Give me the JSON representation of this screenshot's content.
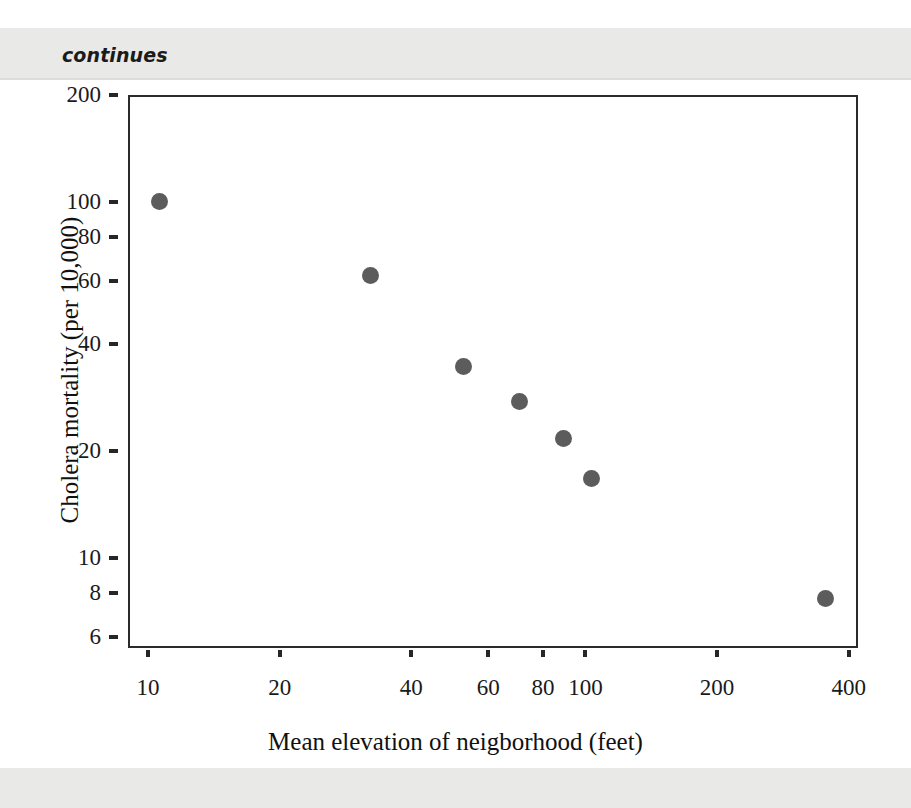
{
  "page": {
    "marginalia": "continues"
  },
  "chart_data": {
    "type": "scatter",
    "title": "",
    "xlabel": "Mean elevation of neigborhood (feet)",
    "ylabel": "Cholera mortality (per 10,000)",
    "xscale": "log",
    "yscale": "log",
    "xlim": [
      9,
      420
    ],
    "ylim": [
      5.6,
      200
    ],
    "grid": false,
    "legend": null,
    "xticks": [
      10,
      20,
      40,
      60,
      80,
      100,
      200,
      400
    ],
    "xticklabels": [
      "10",
      "20",
      "40",
      "60",
      "80",
      "100",
      "200",
      "400"
    ],
    "yticks": [
      200,
      100,
      80,
      60,
      40,
      20,
      10,
      8,
      6
    ],
    "yticklabels": [
      "200",
      "100",
      "80",
      "60",
      "40",
      "20",
      "10",
      "8",
      "6"
    ],
    "marker": "circle",
    "marker_color": "#5c5c5c",
    "marker_size": 17,
    "points": [
      {
        "x": 10.5,
        "y": 102
      },
      {
        "x": 32,
        "y": 63
      },
      {
        "x": 52,
        "y": 35
      },
      {
        "x": 70,
        "y": 28
      },
      {
        "x": 88,
        "y": 22
      },
      {
        "x": 102,
        "y": 17
      },
      {
        "x": 350,
        "y": 7.8
      }
    ]
  },
  "colors": {
    "marker": "#5c5c5c",
    "axis": "#2b2b2b",
    "text": "#1a1a1a",
    "page_band": "#e9e9e7"
  }
}
